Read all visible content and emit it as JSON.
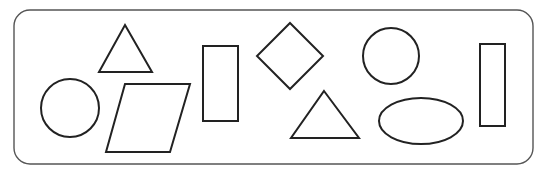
{
  "diagram": {
    "title": "",
    "stroke_color": "#222222",
    "border_color": "#555555",
    "background": "#ffffff",
    "frame": {
      "x": 14,
      "y": 10,
      "width": 519,
      "height": 154,
      "radius": 16
    },
    "shapes": [
      {
        "type": "circle",
        "name": "circle-left",
        "cx": 70,
        "cy": 108,
        "r": 29
      },
      {
        "type": "triangle",
        "name": "triangle-top-left",
        "points": "125,25 152,72 99,72"
      },
      {
        "type": "parallelogram",
        "name": "parallelogram",
        "points": "125,84 190,84 170,152 106,152"
      },
      {
        "type": "rectangle",
        "name": "rectangle-middle",
        "x": 203,
        "y": 46,
        "width": 35,
        "height": 75
      },
      {
        "type": "diamond",
        "name": "diamond",
        "points": "290,23 323,56 290,89 257,56"
      },
      {
        "type": "triangle",
        "name": "triangle-bottom-middle",
        "points": "324,91 359,138 291,138"
      },
      {
        "type": "circle",
        "name": "circle-right",
        "cx": 391,
        "cy": 56,
        "r": 28
      },
      {
        "type": "ellipse",
        "name": "ellipse",
        "cx": 421,
        "cy": 121,
        "rx": 42,
        "ry": 23
      },
      {
        "type": "rectangle",
        "name": "rectangle-right",
        "x": 480,
        "y": 44,
        "width": 25,
        "height": 82
      }
    ]
  }
}
